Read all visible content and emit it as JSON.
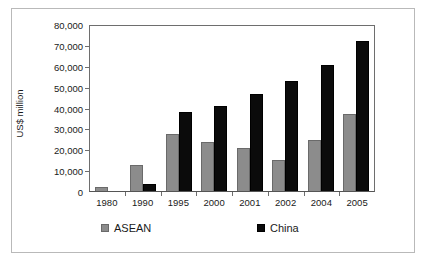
{
  "chart_data": {
    "type": "bar",
    "title": "",
    "subtitle": "",
    "xlabel": "",
    "ylabel": "US$ million",
    "ylim": [
      0,
      80000
    ],
    "ytick_labels": [
      "80,000",
      "70,000",
      "60,000",
      "50,000",
      "40,000",
      "30,000",
      "20,000",
      "10,000",
      "0"
    ],
    "ytick_values": [
      80000,
      70000,
      60000,
      50000,
      40000,
      30000,
      20000,
      10000,
      0
    ],
    "grid": false,
    "legend_position": "bottom",
    "categories": [
      "1980",
      "1990",
      "1995",
      "2000",
      "2001",
      "2002",
      "2004",
      "2005"
    ],
    "series": [
      {
        "name": "ASEAN",
        "color": "#8c8c8c",
        "values": [
          2000,
          12500,
          27500,
          23500,
          20500,
          15000,
          24500,
          37000
        ]
      },
      {
        "name": "China",
        "color": "#0b0b0b",
        "values": [
          0,
          3500,
          38000,
          40500,
          46500,
          52500,
          60500,
          72000
        ]
      }
    ]
  },
  "legend": {
    "asean_label": "ASEAN",
    "china_label": "China",
    "asean_swatch": "square-gray-icon",
    "china_swatch": "square-black-icon"
  }
}
